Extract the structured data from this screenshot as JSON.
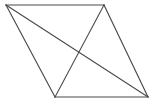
{
  "figure": {
    "shape_type": "parallelogram",
    "background_color": "#ffffff",
    "line_color": "#4a4a4a",
    "line_width": 1.15,
    "canvas": {
      "width": 154,
      "height": 105
    },
    "vertices": [
      {
        "name": "top-left",
        "label": "A",
        "x": 6,
        "y": 5
      },
      {
        "name": "top-right",
        "label": "B",
        "x": 104,
        "y": 5
      },
      {
        "name": "bottom-right",
        "label": "C",
        "x": 148,
        "y": 97
      },
      {
        "name": "bottom-left",
        "label": "D",
        "x": 55,
        "y": 97
      }
    ],
    "edges": [
      {
        "name": "top-edge",
        "from": "top-left",
        "to": "top-right",
        "points": "6,5 104,5"
      },
      {
        "name": "right-edge",
        "from": "top-right",
        "to": "bottom-right",
        "points": "104,5 148,97"
      },
      {
        "name": "bottom-edge",
        "from": "bottom-right",
        "to": "bottom-left",
        "points": "148,97 55,97"
      },
      {
        "name": "left-edge",
        "from": "bottom-left",
        "to": "top-left",
        "points": "55,97 6,5"
      }
    ],
    "diagonals": [
      {
        "name": "diagonal-major",
        "from": "top-left",
        "to": "bottom-right",
        "points": "6,5 148,97"
      },
      {
        "name": "diagonal-minor",
        "from": "top-right",
        "to": "bottom-left",
        "points": "104,5 55,97"
      }
    ],
    "intersection": {
      "name": "diagonal-crossing",
      "x": 77,
      "y": 51
    },
    "outline_path": "M 6,5 L 104,5 L 148,97 L 55,97 Z"
  }
}
